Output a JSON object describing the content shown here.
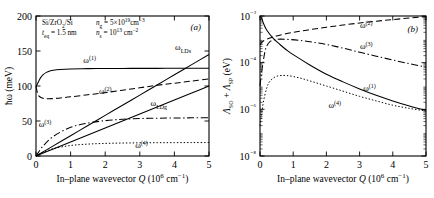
{
  "figure": {
    "panels": [
      "a",
      "b"
    ]
  },
  "panel_a": {
    "id": "(a)",
    "annotations": {
      "material": "Si/ZrO",
      "material_sub": "2",
      "material_tail": "/Si",
      "thickness_sym": "t",
      "thickness_sub": "eq",
      "thickness_val": " = 1.5 nm",
      "ng_sym": "n",
      "ng_sub": "g",
      "ng_val": " = 5×10",
      "ng_exp": "19",
      "ng_unit": "cm",
      "ng_unit_exp": "−3",
      "ns_sym": "n",
      "ns_sub": "s",
      "ns_val": " = 10",
      "ns_exp": "13",
      "ns_unit": " cm",
      "ns_unit_exp": "−2"
    },
    "curve_labels": [
      {
        "key": "w1",
        "base": "ω",
        "sup": "(1)",
        "x": 1.55,
        "y": 133
      },
      {
        "key": "w2",
        "base": "ω",
        "sup": "(2)",
        "x": 2.0,
        "y": 88
      },
      {
        "key": "w3",
        "base": "ω",
        "sup": "(3)",
        "x": 0.26,
        "y": 42
      },
      {
        "key": "w4",
        "base": "ω",
        "sup": "(4)",
        "x": 3.05,
        "y": 12
      },
      {
        "key": "wLDs",
        "base": "ω",
        "sub": "LDs",
        "x": 4.25,
        "y": 152
      },
      {
        "key": "wLDg",
        "base": "ω",
        "sub": "LDg",
        "x": 3.55,
        "y": 72
      }
    ],
    "chart_data": {
      "type": "line",
      "title": "",
      "xlabel": "In–plane wavevector Q (10⁶ cm⁻¹)",
      "ylabel": "ħω (meV)",
      "xlim": [
        0,
        5
      ],
      "ylim": [
        0,
        200
      ],
      "xticks": [
        0,
        1,
        2,
        3,
        4,
        5
      ],
      "yticks": [
        0,
        50,
        100,
        150,
        200
      ],
      "grid": false,
      "legend": "inline-annotations",
      "series": [
        {
          "name": "ω(1)",
          "style": "solid",
          "x": [
            0,
            0.05,
            0.1,
            0.15,
            0.2,
            0.3,
            0.4,
            0.5,
            0.7,
            1.0,
            1.5,
            2.0,
            2.5,
            3.0,
            3.5,
            4.0,
            4.5,
            5.0
          ],
          "y": [
            99,
            104,
            109,
            113,
            116,
            119.5,
            121.5,
            122.6,
            123.6,
            124.3,
            124.8,
            125,
            125.1,
            125.2,
            125.2,
            125.3,
            125.3,
            125.3
          ]
        },
        {
          "name": "ω(2)",
          "style": "dashed",
          "x": [
            0,
            0.05,
            0.1,
            0.2,
            0.3,
            0.5,
            0.7,
            1.0,
            1.5,
            2.0,
            2.5,
            3.0,
            3.5,
            4.0,
            4.5,
            5.0
          ],
          "y": [
            99,
            89,
            85,
            82.5,
            81.8,
            82,
            83,
            84.5,
            87.5,
            90.5,
            94,
            97.5,
            101,
            104,
            107,
            110
          ]
        },
        {
          "name": "ω(3)",
          "style": "dashdot",
          "x": [
            0,
            0.2,
            0.5,
            1.0,
            1.5,
            2.0,
            2.5,
            3.0,
            3.5,
            4.0,
            4.5,
            5.0
          ],
          "y": [
            0,
            14,
            28,
            41,
            47,
            50.5,
            52.5,
            53.5,
            54,
            54.3,
            54.5,
            54.6
          ]
        },
        {
          "name": "ω(4)",
          "style": "dotted",
          "x": [
            0,
            0.2,
            0.5,
            1.0,
            1.5,
            2.0,
            2.5,
            3.0,
            3.5,
            4.0,
            4.5,
            5.0
          ],
          "y": [
            0,
            5,
            10.5,
            15,
            17,
            18,
            18.5,
            18.8,
            19,
            19.1,
            19.2,
            19.2
          ]
        },
        {
          "name": "ωLDs",
          "style": "solid",
          "x": [
            0,
            0.5,
            1.0,
            1.5,
            2.0,
            2.5,
            3.0,
            3.5,
            4.0,
            4.5,
            5.0
          ],
          "y": [
            0,
            14.5,
            29,
            43.5,
            58,
            72.5,
            87,
            101.5,
            116,
            130.5,
            145
          ]
        },
        {
          "name": "ωLDg",
          "style": "solid",
          "x": [
            0,
            0.5,
            1.0,
            1.5,
            2.0,
            2.5,
            3.0,
            3.5,
            4.0,
            4.5,
            5.0
          ],
          "y": [
            0,
            10,
            20,
            30,
            40,
            50,
            60,
            70,
            80,
            90,
            100
          ]
        }
      ]
    }
  },
  "panel_b": {
    "id": "(b)",
    "curve_labels": [
      {
        "key": "w2",
        "base": "ω",
        "sup": "(2)",
        "x": 3.2,
        "y": 0.0032
      },
      {
        "key": "w3",
        "base": "ω",
        "sup": "(3)",
        "x": 3.2,
        "y": 0.0004
      },
      {
        "key": "w1",
        "base": "ω",
        "sup": "(1)",
        "x": 3.3,
        "y": 6e-06
      },
      {
        "key": "w4",
        "base": "ω",
        "sup": "(4)",
        "x": 2.25,
        "y": 1.15e-06
      }
    ],
    "chart_data": {
      "type": "line",
      "title": "",
      "xlabel": "In–plane wavevector Q (10⁶ cm⁻¹)",
      "ylabel": "Λ_SO + Λ_SP (eV)",
      "ylabel_parts": {
        "a": "Λ",
        "a_sub": "SO",
        "plus": " + ",
        "b": "Λ",
        "b_sub": "SP",
        "unit": " (eV)"
      },
      "xlim": [
        0,
        5
      ],
      "ylim": [
        1e-08,
        0.01
      ],
      "xticks": [
        0,
        1,
        2,
        3,
        4,
        5
      ],
      "yticks": [
        "10⁻²",
        "10⁻⁴",
        "10⁻⁶",
        "10⁻⁸"
      ],
      "ytick_values": [
        0.01,
        0.0001,
        1e-06,
        1e-08
      ],
      "grid": false,
      "legend": "inline-annotations",
      "series": [
        {
          "name": "ω(1)",
          "style": "solid",
          "x": [
            0,
            0.05,
            0.1,
            0.2,
            0.4,
            0.6,
            0.8,
            1.0,
            1.5,
            2.0,
            2.5,
            3.0,
            3.5,
            4.0,
            4.5,
            5.0
          ],
          "y": [
            0.01,
            0.008,
            0.005,
            0.0025,
            0.0011,
            0.0006,
            0.00035,
            0.00022,
            8e-05,
            3.2e-05,
            1.5e-05,
            7.5e-06,
            4e-06,
            2.3e-06,
            1.4e-06,
            9e-07
          ]
        },
        {
          "name": "ω(2)",
          "style": "dashed",
          "x": [
            0,
            0.1,
            0.3,
            0.5,
            1.0,
            1.5,
            2.0,
            2.5,
            3.0,
            3.5,
            4.0,
            4.5,
            5.0
          ],
          "y": [
            0.0006,
            0.00085,
            0.00115,
            0.0014,
            0.002,
            0.0026,
            0.0033,
            0.0041,
            0.005,
            0.006,
            0.007,
            0.0082,
            0.0094
          ]
        },
        {
          "name": "ω(3)",
          "style": "dashdot",
          "x": [
            0,
            0.05,
            0.1,
            0.15,
            0.2,
            0.3,
            0.5,
            0.8,
            1.2,
            1.6,
            2.0,
            2.5,
            3.0,
            3.5,
            4.0,
            4.5,
            5.0
          ],
          "y": [
            1e-05,
            4e-05,
            0.00012,
            0.0003,
            0.0005,
            0.0008,
            0.001,
            0.001,
            0.0009,
            0.00075,
            0.0006,
            0.00042,
            0.00028,
            0.00019,
            0.00013,
            9e-05,
            6.5e-05
          ]
        },
        {
          "name": "ω(4)",
          "style": "dotted",
          "x": [
            0,
            0.05,
            0.1,
            0.2,
            0.3,
            0.5,
            0.8,
            1.2,
            1.6,
            2.0,
            2.5,
            3.0,
            3.5,
            4.0,
            4.5,
            5.0
          ],
          "y": [
            2e-07,
            6e-07,
            2e-06,
            8e-06,
            1.6e-05,
            2.6e-05,
            2.8e-05,
            2.2e-05,
            1.5e-05,
            1e-05,
            6e-06,
            3.6e-06,
            2.3e-06,
            1.5e-06,
            1.1e-06,
            8.5e-07
          ]
        }
      ]
    }
  }
}
